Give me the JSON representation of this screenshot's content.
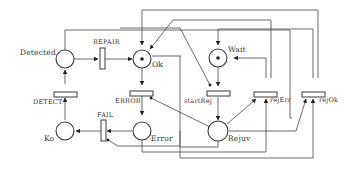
{
  "diagram": {
    "type": "petri-net",
    "places": [
      {
        "id": "detected",
        "label": "Detected",
        "tokens": 0
      },
      {
        "id": "ok",
        "label": "Ok",
        "tokens": 1
      },
      {
        "id": "wait",
        "label": "Wait",
        "tokens": 1
      },
      {
        "id": "ko",
        "label": "Ko",
        "tokens": 0
      },
      {
        "id": "error",
        "label": "Error",
        "tokens": 0
      },
      {
        "id": "rejuv",
        "label": "Rejuv",
        "tokens": 0
      }
    ],
    "transitions": [
      {
        "id": "repair",
        "label": "REPAIR"
      },
      {
        "id": "detect",
        "label": "DETECT"
      },
      {
        "id": "error_t",
        "label": "ERROR"
      },
      {
        "id": "fail",
        "label": "FAIL"
      },
      {
        "id": "startrej",
        "label": "startRej"
      },
      {
        "id": "rejerr",
        "label": "rejErr"
      },
      {
        "id": "rejok",
        "label": "rejOk"
      }
    ],
    "labels": {
      "detected": "Detected",
      "repair": "REPAIR",
      "ok": "Ok",
      "wait": "Wait",
      "detect": "DETECT",
      "error_t": "ERROR",
      "startrej": "startRej",
      "rejerr": "rejErr",
      "rejok": "rejOk",
      "fail": "FAIL",
      "ko": "Ko",
      "error": "Error",
      "rejuv": "Rejuv"
    },
    "colors": {
      "stroke": "#3a3a3a",
      "background": "#ffffff",
      "token": "#222222"
    }
  }
}
